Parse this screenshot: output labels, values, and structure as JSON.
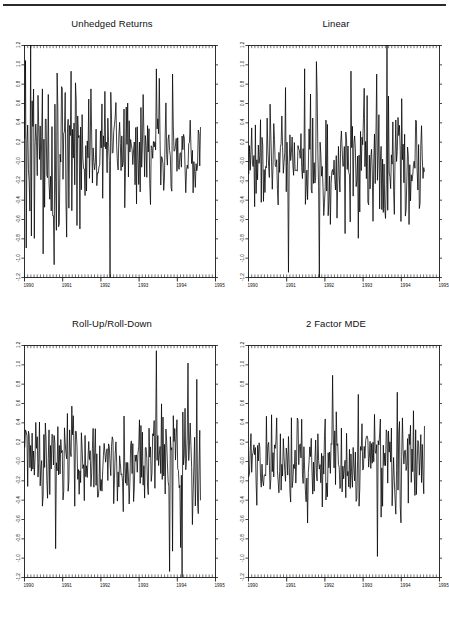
{
  "document": {
    "rule_present": true,
    "background_color": "#ffffff",
    "ink_color": "#101010"
  },
  "layout": {
    "rows": 2,
    "cols": 2,
    "panel_order": [
      "unhedged-returns",
      "linear",
      "roll-up-roll-down",
      "2-factor-mde"
    ]
  },
  "chart_data": [
    {
      "type": "line",
      "id": "unhedged-returns",
      "title": "Unhedged Returns",
      "xlabel": "",
      "ylabel": "",
      "grid": false,
      "legend": "none",
      "xlim": [
        1990.0,
        1995.0
      ],
      "ylim": [
        -1.2,
        1.2
      ],
      "xticks": [
        1990,
        1991,
        1992,
        1993,
        1994,
        1995
      ],
      "xtick_labels": [
        "1990",
        "1991",
        "1992",
        "1993",
        "1994",
        "1995"
      ],
      "yticks": [
        1.2,
        1.0,
        0.8,
        0.6,
        0.4,
        0.2,
        -0.0,
        -0.2,
        -0.4,
        -0.6,
        -0.8,
        -1.0,
        -1.2
      ],
      "ytick_labels": [
        "1.2",
        "1.0",
        "0.8",
        "0.6",
        "0.4",
        "0.2",
        "-0.0",
        "-0.2",
        "-0.4",
        "-0.6",
        "-0.8",
        "-1.0",
        "-1.2"
      ],
      "x_start": 1990.02,
      "x_end": 1994.62,
      "n_points": 240,
      "seed": 17,
      "amplitude_profile": [
        0.62,
        0.58,
        0.5,
        0.44,
        0.4,
        0.34,
        0.26,
        0.2,
        0.17
      ],
      "baseline": 0.04,
      "clip": [
        -1.2,
        1.2
      ],
      "notes": "Dense high-frequency weekly return series; volatility decays from 1990 through 1994."
    },
    {
      "type": "line",
      "id": "linear",
      "title": "Linear",
      "xlabel": "",
      "ylabel": "",
      "grid": false,
      "legend": "none",
      "xlim": [
        1990.0,
        1995.0
      ],
      "ylim": [
        -1.2,
        1.2
      ],
      "xticks": [
        1990,
        1991,
        1992,
        1993,
        1994,
        1995
      ],
      "xtick_labels": [
        "1990",
        "1991",
        "1992",
        "1993",
        "1994",
        "1995"
      ],
      "yticks": [
        1.2,
        1.0,
        0.8,
        0.6,
        0.4,
        0.2,
        -0.0,
        -0.2,
        -0.4,
        -0.6,
        -0.8,
        -1.0,
        -1.2
      ],
      "ytick_labels": [
        "1.2",
        "1.0",
        "0.8",
        "0.6",
        "0.4",
        "0.2",
        "-0.0",
        "-0.2",
        "-0.4",
        "-0.6",
        "-0.8",
        "-1.0",
        "-1.2"
      ],
      "x_start": 1990.02,
      "x_end": 1994.62,
      "n_points": 240,
      "seed": 41,
      "amplitude_profile": [
        0.24,
        0.26,
        0.28,
        0.3,
        0.34,
        0.42,
        0.44,
        0.38,
        0.3
      ],
      "baseline": 0.0,
      "clip": [
        -1.2,
        1.2
      ],
      "notes": "Hedged residuals; volatility rises mid-sample around 1992-1993 then eases."
    },
    {
      "type": "line",
      "id": "roll-up-roll-down",
      "title": "Roll-Up/Roll-Down",
      "xlabel": "",
      "ylabel": "",
      "grid": false,
      "legend": "none",
      "xlim": [
        1990.0,
        1995.0
      ],
      "ylim": [
        -1.2,
        1.2
      ],
      "xticks": [
        1990,
        1991,
        1992,
        1993,
        1994,
        1995
      ],
      "xtick_labels": [
        "1990",
        "1991",
        "1992",
        "1993",
        "1994",
        "1995"
      ],
      "yticks": [
        1.2,
        1.0,
        0.8,
        0.6,
        0.4,
        0.2,
        -0.0,
        -0.2,
        -0.4,
        -0.6,
        -0.8,
        -1.0,
        -1.2
      ],
      "ytick_labels": [
        "1.2",
        "1.0",
        "0.8",
        "0.6",
        "0.4",
        "0.2",
        "-0.0",
        "-0.2",
        "-0.4",
        "-0.6",
        "-0.8",
        "-1.0",
        "-1.2"
      ],
      "x_start": 1990.02,
      "x_end": 1994.62,
      "n_points": 240,
      "seed": 73,
      "amplitude_profile": [
        0.24,
        0.24,
        0.24,
        0.26,
        0.26,
        0.3,
        0.3,
        0.4,
        0.44
      ],
      "baseline": 0.0,
      "clip": [
        -1.2,
        1.2
      ],
      "notes": "Residuals tighten through the middle of the sample, then widen sharply in 1994."
    },
    {
      "type": "line",
      "id": "2-factor-mde",
      "title": "2 Factor MDE",
      "xlabel": "",
      "ylabel": "",
      "grid": false,
      "legend": "none",
      "xlim": [
        1990.0,
        1995.0
      ],
      "ylim": [
        -1.2,
        1.2
      ],
      "xticks": [
        1990,
        1991,
        1992,
        1993,
        1994,
        1995
      ],
      "xtick_labels": [
        "1990",
        "1991",
        "1992",
        "1993",
        "1994",
        "1995"
      ],
      "yticks": [
        1.2,
        1.0,
        0.8,
        0.6,
        0.4,
        0.2,
        -0.0,
        -0.2,
        -0.4,
        -0.6,
        -0.8,
        -1.0,
        -1.2
      ],
      "ytick_labels": [
        "1.2",
        "1.0",
        "0.8",
        "0.6",
        "0.4",
        "0.2",
        "-0.0",
        "-0.2",
        "-0.4",
        "-0.6",
        "-0.8",
        "-1.0",
        "-1.2"
      ],
      "x_start": 1990.02,
      "x_end": 1994.62,
      "n_points": 240,
      "seed": 105,
      "amplitude_profile": [
        0.22,
        0.24,
        0.26,
        0.26,
        0.26,
        0.28,
        0.26,
        0.22,
        0.18
      ],
      "baseline": 0.0,
      "clip": [
        -1.2,
        1.2
      ],
      "notes": "Tightest residual band of the four panels; modest taper after 1994."
    }
  ]
}
